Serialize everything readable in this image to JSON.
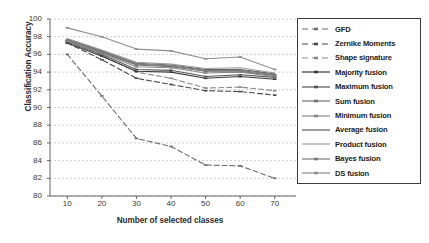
{
  "chart_data": {
    "type": "line",
    "title": "",
    "xlabel": "Number of selected classes",
    "ylabel": "Classification Accuracy",
    "xlim": [
      5,
      75
    ],
    "ylim": [
      80,
      100
    ],
    "xticks": [
      10,
      20,
      30,
      40,
      50,
      60,
      70
    ],
    "yticks": [
      80,
      82,
      84,
      86,
      88,
      90,
      92,
      94,
      96,
      98,
      100
    ],
    "x": [
      10,
      20,
      30,
      40,
      50,
      60,
      70
    ],
    "grid": "horizontal-dashed",
    "legend_position": "right-outside",
    "series": [
      {
        "name": "GFD",
        "style": "dashed",
        "marker": "dash",
        "color": "#6e6e6e",
        "values": [
          96.0,
          91.3,
          86.5,
          85.6,
          83.5,
          83.4,
          82.0
        ]
      },
      {
        "name": "Zernike Moments",
        "style": "dashed",
        "marker": "dash",
        "color": "#4a4a4a",
        "values": [
          97.3,
          95.4,
          93.3,
          92.6,
          91.9,
          91.8,
          91.4
        ]
      },
      {
        "name": "Shape signature",
        "style": "dashed",
        "marker": "dash",
        "color": "#8a8a8a",
        "values": [
          97.5,
          95.9,
          94.0,
          93.3,
          92.2,
          92.3,
          91.9
        ]
      },
      {
        "name": "Majority fusion",
        "style": "solid",
        "marker": "dash",
        "color": "#3a3a3a",
        "values": [
          97.3,
          95.8,
          94.1,
          94.0,
          93.3,
          93.5,
          93.2
        ]
      },
      {
        "name": "Maximum fusion",
        "style": "solid",
        "marker": "dash",
        "color": "#555555",
        "values": [
          97.4,
          96.0,
          94.3,
          94.2,
          93.5,
          93.7,
          93.4
        ]
      },
      {
        "name": "Sum fusion",
        "style": "solid",
        "marker": "dash",
        "color": "#707070",
        "values": [
          97.6,
          96.2,
          94.8,
          94.6,
          94.1,
          94.1,
          93.6
        ]
      },
      {
        "name": "Minimum fusion",
        "style": "solid",
        "marker": "dash",
        "color": "#888888",
        "values": [
          97.5,
          96.1,
          94.6,
          94.5,
          93.9,
          94.0,
          93.5
        ]
      },
      {
        "name": "Average fusion",
        "style": "solid",
        "marker": "none",
        "color": "#606060",
        "values": [
          97.7,
          96.4,
          95.0,
          94.8,
          94.3,
          94.3,
          93.8
        ]
      },
      {
        "name": "Product fusion",
        "style": "solid",
        "marker": "none",
        "color": "#9a9a9a",
        "values": [
          97.8,
          96.5,
          95.1,
          94.9,
          94.4,
          94.5,
          93.9
        ]
      },
      {
        "name": "Bayes fusion",
        "style": "solid",
        "marker": "dash",
        "color": "#7a7a7a",
        "values": [
          97.6,
          96.3,
          94.9,
          94.7,
          94.2,
          94.2,
          93.7
        ]
      },
      {
        "name": "DS fusion",
        "style": "solid",
        "marker": "dash",
        "color": "#8f8f8f",
        "values": [
          99.0,
          98.0,
          96.6,
          96.4,
          95.5,
          95.7,
          94.3
        ]
      }
    ]
  }
}
